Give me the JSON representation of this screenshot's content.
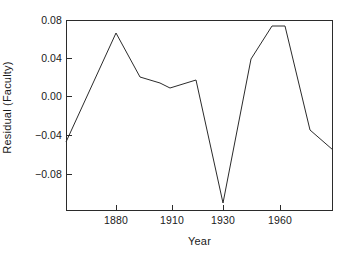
{
  "chart_data": {
    "type": "line",
    "title": "",
    "xlabel": "Year",
    "ylabel": "Residual (Faculty)",
    "grid": false,
    "legend": null,
    "xlim": [
      1865,
      1978
    ],
    "ylim": [
      -0.1134,
      0.08
    ],
    "yticks": [
      0.08,
      0.04,
      0.0,
      -0.04,
      -0.08
    ],
    "ytick_labels": [
      "0.08",
      "0.04",
      "0.00",
      "−0.04",
      "−0.08"
    ],
    "xticks": [
      1880,
      1910,
      1930,
      1960
    ],
    "xtick_labels": [
      "1880",
      "1910",
      "1930",
      "1960"
    ],
    "series": [
      {
        "name": "Residual (Faculty)",
        "color": "#2b2b2b",
        "x": [
          1866,
          1880,
          1890,
          1900,
          1910,
          1920,
          1930,
          1940,
          1950,
          1955,
          1965,
          1975
        ],
        "y": [
          -0.062,
          0.066,
          0.015,
          0.008,
          0.003,
          0.012,
          -0.107,
          0.031,
          0.073,
          0.073,
          -0.033,
          -0.054
        ],
        "points_px": [
          [
            0,
            122
          ],
          [
            50,
            13
          ],
          [
            74,
            57
          ],
          [
            94,
            63
          ],
          [
            104,
            68
          ],
          [
            130,
            60
          ],
          [
            157,
            183
          ],
          [
            185,
            39
          ],
          [
            206,
            6
          ],
          [
            219,
            6
          ],
          [
            244,
            110
          ],
          [
            267,
            130
          ]
        ]
      }
    ]
  },
  "axes": {
    "y_title": "Residual (Faculty)",
    "x_title": "Year",
    "y_ticks": [
      {
        "label": "0.08",
        "top": 15
      },
      {
        "label": "0.04",
        "top": 53
      },
      {
        "label": "0.00",
        "top": 91
      },
      {
        "label": "−0.04",
        "top": 130
      },
      {
        "label": "−0.08",
        "top": 169
      }
    ],
    "y_tick_marks": [
      20,
      58,
      96,
      135,
      174
    ],
    "x_ticks": [
      {
        "label": "1880",
        "left": 116
      },
      {
        "label": "1910",
        "left": 172
      },
      {
        "label": "1930",
        "left": 223
      },
      {
        "label": "1960",
        "left": 280
      }
    ]
  },
  "style": {
    "axis_color": "#2b2b2b",
    "line_color": "#2b2b2b",
    "background": "#ffffff"
  }
}
